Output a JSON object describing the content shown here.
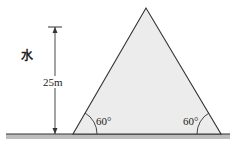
{
  "diagram": {
    "type": "dam-cross-section",
    "labels": {
      "water": "水",
      "height": "25m",
      "angle_left": "60°",
      "angle_right": "60°"
    },
    "shape": "isosceles triangle (equilateral profile) dam on ground",
    "colors": {
      "outline": "#333333",
      "dam_fill": "#ececec",
      "ground_band": "#bdbdbd",
      "background": "#ffffff"
    }
  }
}
